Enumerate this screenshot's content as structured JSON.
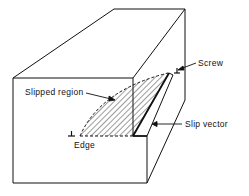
{
  "diagram": {
    "labels": {
      "screw": "Screw",
      "slipped_region": "Slipped region",
      "slip_vector": "Slip vector",
      "edge": "Edge"
    },
    "symbols": {
      "edge_dislocation": "⊥",
      "screw_dislocation": "⊥"
    },
    "colors": {
      "line": "#111111",
      "background": "#ffffff"
    }
  }
}
